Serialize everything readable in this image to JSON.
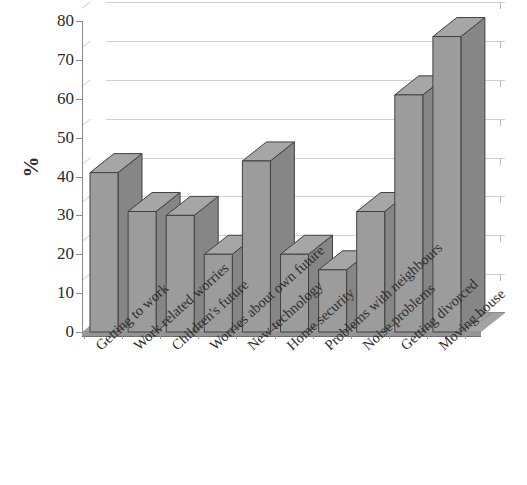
{
  "chart_data": {
    "type": "bar",
    "title": "",
    "subtitle": "",
    "xlabel": "",
    "ylabel": "%",
    "ylim": [
      0,
      80
    ],
    "ytick_step": 10,
    "yticks": [
      0,
      10,
      20,
      30,
      40,
      50,
      60,
      70,
      80
    ],
    "grid": true,
    "grid_axis": "y",
    "legend": false,
    "legend_position": "none",
    "style": "3d-column",
    "categories": [
      "Getting to work",
      "Work related worries",
      "Children's future",
      "Worries about own future",
      "New technology",
      "Home security",
      "Problems with neighbours",
      "Noise problems",
      "Getting divorced",
      "Moving house"
    ],
    "values": [
      41,
      31,
      30,
      20,
      44,
      20,
      16,
      31,
      61,
      76
    ],
    "series": [
      {
        "name": "%",
        "values": [
          41,
          31,
          30,
          20,
          44,
          20,
          16,
          31,
          61,
          76
        ]
      }
    ]
  },
  "colors": {
    "bar_front": "#9c9c9c",
    "bar_side": "#868686",
    "bar_top": "#a6a6a6",
    "bar_outline": "#404040",
    "gridline": "#d2d2d2",
    "axis": "#8a8a8a",
    "floor_top": "#a3a3a3",
    "floor_front": "#949494",
    "text": "#2b2b2b",
    "background": "#ffffff"
  }
}
